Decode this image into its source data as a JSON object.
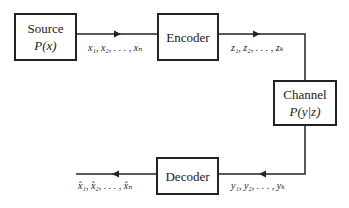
{
  "diagram": {
    "type": "communication-system-block-diagram",
    "blocks": {
      "source": {
        "label": "Source",
        "sublabel": "P(x)"
      },
      "encoder": {
        "label": "Encoder"
      },
      "channel": {
        "label": "Channel",
        "sublabel": "P(y|z)"
      },
      "decoder": {
        "label": "Decoder"
      }
    },
    "edges": [
      {
        "from": "source",
        "to": "encoder",
        "label": "x₁, x₂, . . . , xₙ"
      },
      {
        "from": "encoder",
        "to": "channel",
        "label": "z₁, z₂, . . . , zₖ"
      },
      {
        "from": "channel",
        "to": "decoder",
        "label": "y₁, y₂, . . . , yₖ"
      },
      {
        "from": "decoder",
        "to": "output",
        "label": "x̂₁, x̂₂, . . . , x̂ₙ"
      }
    ],
    "colors": {
      "line": "#222222",
      "background": "#ffffff"
    }
  }
}
